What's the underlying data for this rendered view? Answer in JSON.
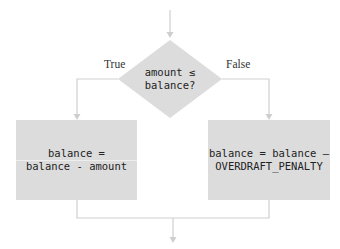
{
  "diagram": {
    "type": "flowchart",
    "colors": {
      "shape_fill": "#dcdcdc",
      "connector": "#cfcfcf",
      "text": "#222222"
    },
    "decision": {
      "line1": "amount ≤",
      "line2": "balance?"
    },
    "branches": {
      "true_label": "True",
      "false_label": "False"
    },
    "true_box": {
      "line1": "balance =",
      "line2": "balance - amount"
    },
    "false_box": {
      "line1": "balance = balance –",
      "line2": "OVERDRAFT_PENALTY"
    }
  }
}
